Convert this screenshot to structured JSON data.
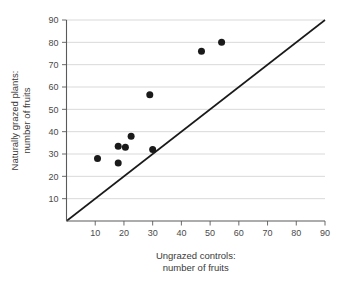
{
  "chart_data": {
    "type": "scatter",
    "title": "",
    "xlabel": "Ungrazed controls: number of fruits",
    "xlabel_line1": "Ungrazed controls:",
    "xlabel_line2": "number of fruits",
    "ylabel": "Naturally grazed plants: number of fruits",
    "ylabel_line1": "Naturally grazed plants:",
    "ylabel_line2": "number of fruits",
    "xlim": [
      0,
      90
    ],
    "ylim": [
      0,
      90
    ],
    "xticks": [
      10,
      20,
      30,
      40,
      50,
      60,
      70,
      80,
      90
    ],
    "yticks": [
      10,
      20,
      30,
      40,
      50,
      60,
      70,
      80,
      90
    ],
    "grid": "horizontal",
    "legend": "none",
    "marker_color": "#1a1a1a",
    "grid_color": "#c9c9c9",
    "axis_color": "#5a5a5a",
    "points": [
      {
        "x": 10.8,
        "y": 28.0
      },
      {
        "x": 18.0,
        "y": 33.5
      },
      {
        "x": 18.0,
        "y": 26.0
      },
      {
        "x": 20.5,
        "y": 33.0
      },
      {
        "x": 22.5,
        "y": 38.0
      },
      {
        "x": 29.0,
        "y": 56.5
      },
      {
        "x": 30.0,
        "y": 32.0
      },
      {
        "x": 47.0,
        "y": 76.0
      },
      {
        "x": 54.0,
        "y": 80.0
      }
    ],
    "annotations": [
      {
        "name": "identity-line",
        "type": "line",
        "from": [
          0,
          0
        ],
        "to": [
          90,
          90
        ],
        "label": "y = x reference line"
      }
    ]
  }
}
